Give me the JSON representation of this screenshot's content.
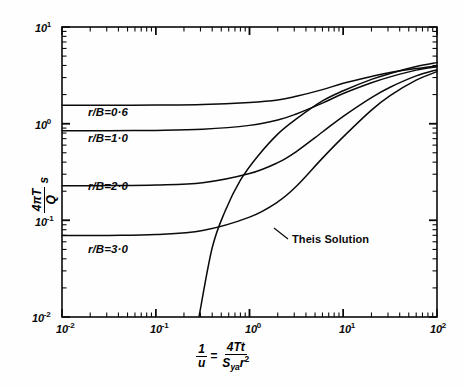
{
  "figure": {
    "background_color": "#fefefe",
    "ink_color": "#0a0a0a",
    "plot_frame": {
      "left": 62,
      "top": 27,
      "right": 437,
      "bottom": 317
    }
  },
  "axes": {
    "x": {
      "scale": "log",
      "min": 0.01,
      "max": 100,
      "tick_labels": [
        "10",
        "10",
        "10",
        "10",
        "10"
      ],
      "tick_exponents": [
        "-2",
        "-1",
        "0",
        "1",
        "2"
      ],
      "tick_values": [
        0.01,
        0.1,
        1,
        10,
        100
      ],
      "label_parts": {
        "lhs_num": "1",
        "lhs_den": "u",
        "equals": "=",
        "rhs_num": "4Tt",
        "rhs_den_main": "S",
        "rhs_den_sub": "ya",
        "rhs_den_r": "r",
        "rhs_den_exp": "2"
      }
    },
    "y": {
      "scale": "log",
      "min": 0.01,
      "max": 10,
      "tick_labels": [
        "10",
        "10",
        "10",
        "10"
      ],
      "tick_exponents": [
        "1",
        "0",
        "-1",
        "-2"
      ],
      "tick_values": [
        10,
        1,
        0.1,
        0.01
      ],
      "label_parts": {
        "num": "4πT",
        "den": "Q",
        "trailing": "s"
      }
    }
  },
  "annotations": {
    "theis": {
      "text": "Theis Solution",
      "x": 292,
      "y": 239
    }
  },
  "chart_data": {
    "type": "line",
    "title": "",
    "xlabel": "1/u = 4Tt / (S_ya r^2)",
    "ylabel": "4πT/Q · s",
    "xscale": "log",
    "yscale": "log",
    "xlim": [
      0.01,
      100
    ],
    "ylim": [
      0.01,
      10
    ],
    "grid": false,
    "legend": "inline-curve-labels",
    "series": [
      {
        "name": "r/B=0·6",
        "label": "r/B=0·6",
        "label_pos": {
          "x": 88,
          "y": 113
        },
        "x": [
          0.01,
          0.0316,
          0.1,
          0.316,
          1.0,
          2.0,
          3.16,
          6.0,
          10.0,
          20.0,
          31.6,
          60.0,
          100.0
        ],
        "y": [
          1.55,
          1.55,
          1.56,
          1.58,
          1.66,
          1.76,
          1.92,
          2.25,
          2.62,
          3.08,
          3.38,
          3.72,
          3.95
        ]
      },
      {
        "name": "r/B=1·0",
        "label": "r/B=1·0",
        "label_pos": {
          "x": 88,
          "y": 139
        },
        "x": [
          0.01,
          0.0316,
          0.1,
          0.316,
          1.0,
          2.0,
          3.16,
          6.0,
          10.0,
          20.0,
          31.6,
          60.0,
          100.0
        ],
        "y": [
          0.845,
          0.846,
          0.852,
          0.875,
          0.96,
          1.09,
          1.26,
          1.63,
          2.05,
          2.65,
          3.05,
          3.58,
          3.88
        ]
      },
      {
        "name": "r/B=2·0",
        "label": "r/B=2·0",
        "label_pos": {
          "x": 88,
          "y": 187
        },
        "x": [
          0.01,
          0.0316,
          0.1,
          0.316,
          1.0,
          2.0,
          3.16,
          6.0,
          10.0,
          20.0,
          31.6,
          60.0,
          100.0
        ],
        "y": [
          0.228,
          0.229,
          0.232,
          0.245,
          0.305,
          0.395,
          0.515,
          0.82,
          1.19,
          1.86,
          2.38,
          3.12,
          3.62
        ]
      },
      {
        "name": "r/B=3·0",
        "label": "r/B=3·0",
        "label_pos": {
          "x": 88,
          "y": 250
        },
        "x": [
          0.01,
          0.0316,
          0.1,
          0.316,
          1.0,
          2.0,
          3.16,
          6.0,
          10.0,
          20.0,
          31.6,
          60.0,
          100.0
        ],
        "y": [
          0.0695,
          0.0698,
          0.0712,
          0.0785,
          0.108,
          0.155,
          0.225,
          0.44,
          0.73,
          1.38,
          1.95,
          2.82,
          3.45
        ]
      },
      {
        "name": "Theis Solution",
        "label": "Theis Solution",
        "label_pos": {
          "x": 292,
          "y": 239
        },
        "x": [
          0.29,
          0.4,
          0.55,
          0.8,
          1.2,
          2.0,
          3.16,
          6.0,
          10.0,
          20.0,
          31.6,
          60.0,
          100.0
        ],
        "y": [
          0.0102,
          0.052,
          0.125,
          0.26,
          0.45,
          0.78,
          1.12,
          1.72,
          2.19,
          2.87,
          3.3,
          3.9,
          4.28
        ]
      }
    ]
  }
}
